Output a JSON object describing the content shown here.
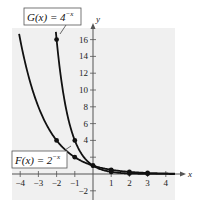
{
  "chart_data": {
    "type": "line",
    "title": "",
    "xlabel": "x",
    "ylabel": "y",
    "xlim": [
      -4.5,
      4.5
    ],
    "ylim": [
      -3,
      17
    ],
    "grid": false,
    "background": "#f0f0f0",
    "x_ticks": [
      -4,
      -3,
      -2,
      -1,
      1,
      2,
      3,
      4
    ],
    "x_tick_labels": [
      "−4",
      "−3",
      "−2",
      "−1",
      "1",
      "2",
      "3",
      "4"
    ],
    "y_ticks": [
      -2,
      2,
      4,
      6,
      8,
      10,
      12,
      14,
      16
    ],
    "y_tick_labels": [
      "−2",
      "",
      "4",
      "6",
      "8",
      "10",
      "12",
      "14",
      "16"
    ],
    "series": [
      {
        "name": "G(x) = 4^(−x)",
        "label_text": "G(x) = 4",
        "label_exponent": "−x",
        "function": "4^(-x)",
        "points": [
          {
            "x": -2,
            "y": 16
          },
          {
            "x": -1,
            "y": 4
          },
          {
            "x": 0,
            "y": 1
          },
          {
            "x": 1,
            "y": 0.25
          },
          {
            "x": 2,
            "y": 0.0625
          },
          {
            "x": 3,
            "y": 0.015625
          }
        ]
      },
      {
        "name": "F(x) = 2^(−x)",
        "label_text": "F(x) = 2",
        "label_exponent": "−x",
        "function": "2^(-x)",
        "points": [
          {
            "x": -2,
            "y": 4
          },
          {
            "x": -1,
            "y": 2
          },
          {
            "x": 0,
            "y": 1
          },
          {
            "x": 1,
            "y": 0.5
          },
          {
            "x": 2,
            "y": 0.25
          },
          {
            "x": 3,
            "y": 0.125
          }
        ]
      }
    ],
    "annotations": [
      {
        "text": "G(x) = 4^(−x)",
        "position": "top-left, callout to G curve"
      },
      {
        "text": "F(x) = 2^(−x)",
        "position": "lower-left, callout to F curve"
      }
    ]
  },
  "labels": {
    "x_axis": "x",
    "y_axis": "y",
    "g_label_main": "G(x) = 4",
    "g_label_exp": "−x",
    "f_label_main": "F(x) = 2",
    "f_label_exp": "−x"
  }
}
